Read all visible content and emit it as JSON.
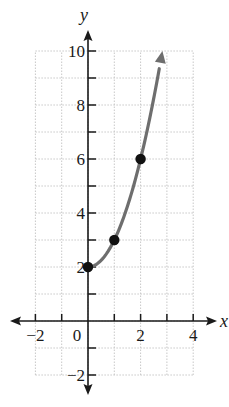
{
  "chart_data": {
    "type": "line",
    "title": "",
    "xlabel": "x",
    "ylabel": "y",
    "xlim": [
      -2,
      4
    ],
    "ylim": [
      -2,
      10
    ],
    "grid": true,
    "x_ticks": [
      -2,
      -1,
      0,
      1,
      2,
      3,
      4
    ],
    "x_tick_labels": [
      "−2",
      "0",
      "2",
      "4"
    ],
    "x_tick_label_values": [
      -2,
      0,
      2,
      4
    ],
    "y_ticks": [
      -2,
      -1,
      1,
      2,
      3,
      4,
      5,
      6,
      7,
      8,
      9,
      10
    ],
    "y_tick_labels": [
      "−2",
      "2",
      "4",
      "6",
      "8",
      "10"
    ],
    "y_tick_label_values": [
      -2,
      2,
      4,
      6,
      8,
      10
    ],
    "series": [
      {
        "name": "curve",
        "description": "y = x^2 + 2 for x >= 0, with arrow continuing upward",
        "x": [
          0,
          0.5,
          1,
          1.5,
          2,
          2.5,
          2.83
        ],
        "y": [
          2,
          2.25,
          3,
          4.25,
          6,
          8.25,
          10
        ],
        "color": "#6e6e6e",
        "arrow_end": true
      }
    ],
    "points": [
      {
        "x": 0,
        "y": 2
      },
      {
        "x": 1,
        "y": 3
      },
      {
        "x": 2,
        "y": 6
      }
    ],
    "point_color": "#111111",
    "axis_color": "#1a1a1a",
    "grid_color": "#c8c8c8"
  },
  "labels": {
    "x_axis": "x",
    "y_axis": "y"
  }
}
